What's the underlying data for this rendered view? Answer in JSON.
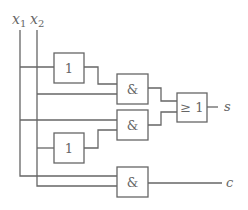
{
  "diagram": {
    "inputs": [
      {
        "name": "x1",
        "label": "x",
        "sub": "1"
      },
      {
        "name": "x2",
        "label": "x",
        "sub": "2"
      }
    ],
    "gates": [
      {
        "id": "not1",
        "type": "NOT",
        "label": "1"
      },
      {
        "id": "and1",
        "type": "AND",
        "label": "&"
      },
      {
        "id": "and2",
        "type": "AND",
        "label": "&"
      },
      {
        "id": "not2",
        "type": "NOT",
        "label": "1"
      },
      {
        "id": "or1",
        "type": "OR",
        "label": "≥ 1"
      },
      {
        "id": "and3",
        "type": "AND",
        "label": "&"
      }
    ],
    "outputs": [
      {
        "name": "s",
        "label": "s"
      },
      {
        "name": "c",
        "label": "c"
      }
    ]
  }
}
